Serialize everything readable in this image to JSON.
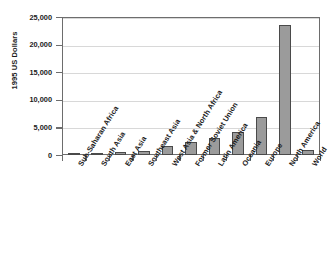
{
  "chart_data": {
    "type": "bar",
    "title": "",
    "xlabel": "",
    "ylabel": "1995 US Dollars",
    "ylim": [
      0,
      25000
    ],
    "ytick_labels": [
      "0",
      "5,000",
      "10,000",
      "15,000",
      "20,000",
      "25,000"
    ],
    "ytick_values": [
      0,
      5000,
      10000,
      15000,
      20000,
      25000
    ],
    "grid": true,
    "legend": "none",
    "categories": [
      "Sub-Saharan Africa",
      "South Asia",
      "East Asia",
      "Southeast Asia",
      "West Asia & North Africa",
      "Former Soviet Union",
      "Latin America",
      "Oceania",
      "Europe",
      "North America",
      "World"
    ],
    "values": [
      350,
      400,
      500,
      800,
      1700,
      2350,
      3100,
      4200,
      6950,
      23550,
      900
    ],
    "bar_color": "#9b9b9b",
    "bar_edge_color": "#4a4a4a",
    "axis_color": "#6d6d6d",
    "gridline_color": "#d8d8d8",
    "background_color": "#ffffff",
    "text_color": "#1a1a1a"
  }
}
